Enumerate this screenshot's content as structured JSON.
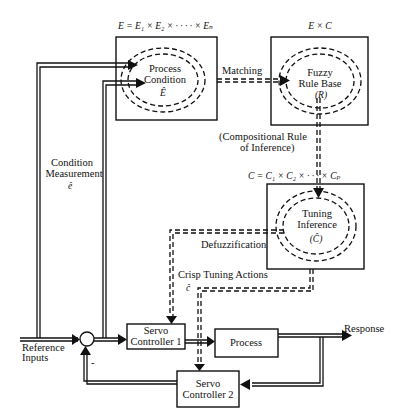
{
  "diagram": {
    "type": "block-diagram",
    "nodes": {
      "process_condition": {
        "label_line1": "Process",
        "label_line2": "Condition",
        "symbol": "Ê",
        "set_label": "E = E₁ × E₂ ×  · · · ·  × Eₙ"
      },
      "fuzzy_rule_base": {
        "label_line1": "Fuzzy",
        "label_line2": "Rule Base",
        "symbol": "(R)",
        "set_label": "E × C"
      },
      "tuning_inference": {
        "label_line1": "Tuning",
        "label_line2": "Inference",
        "symbol": "(Ĉ)",
        "set_label": "C = C₁ × C₂ ×  · · ·  × Cₚ"
      },
      "servo_controller_1": {
        "label_line1": "Servo",
        "label_line2": "Controller 1"
      },
      "servo_controller_2": {
        "label_line1": "Servo",
        "label_line2": "Controller 2"
      },
      "process": {
        "label": "Process"
      }
    },
    "edge_labels": {
      "matching": "Matching",
      "compositional_line1": "(Compositional Rule",
      "compositional_line2": "of Inference)",
      "defuzzification": "Defuzzification",
      "crisp_line1": "Crisp Tuning Actions",
      "crisp_symbol": "ĉ",
      "condition_line1": "Condition",
      "condition_line2": "Measurement",
      "condition_symbol": "ê",
      "reference_line1": "Reference",
      "reference_line2": "Inputs",
      "response": "Response",
      "minus_sign": "-"
    }
  }
}
